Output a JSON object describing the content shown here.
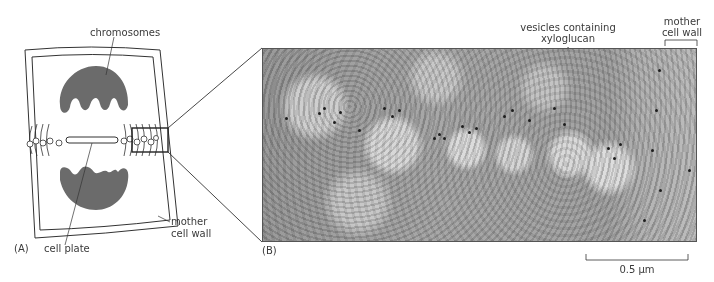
{
  "panel_a": {
    "panel_label": "(A)",
    "labels": {
      "chromosomes": "chromosomes",
      "cell_plate": "cell plate",
      "mother_cell_wall_line1": "mother",
      "mother_cell_wall_line2": "cell wall"
    }
  },
  "panel_b": {
    "panel_label": "(B)",
    "labels": {
      "vesicles_line1": "vesicles containing",
      "vesicles_line2": "xyloglucan",
      "mother_cell_wall_line1": "mother",
      "mother_cell_wall_line2": "cell wall"
    },
    "scale_bar": {
      "label": "0.5 µm"
    }
  },
  "colors": {
    "chromosome_fill": "#6b6b6b",
    "line": "#333333",
    "micrograph_base": "#a3a3a3",
    "gold_particle": "#1e1e1e"
  }
}
